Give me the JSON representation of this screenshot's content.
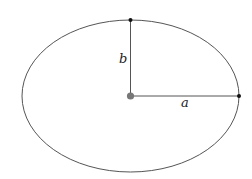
{
  "diagram": {
    "ellipse": {
      "cx": 130.5,
      "cy": 96,
      "rx": 108.5,
      "ry": 76,
      "stroke": "#555555"
    },
    "center_point": {
      "x": 130.5,
      "y": 96,
      "r": 3.6,
      "color": "#777777"
    },
    "top_point": {
      "x": 130.5,
      "y": 20,
      "r": 2,
      "color": "#111111"
    },
    "right_point": {
      "x": 239,
      "y": 96,
      "r": 2,
      "color": "#111111"
    },
    "semi_minor": {
      "label": "b"
    },
    "semi_major": {
      "label": "a"
    }
  }
}
